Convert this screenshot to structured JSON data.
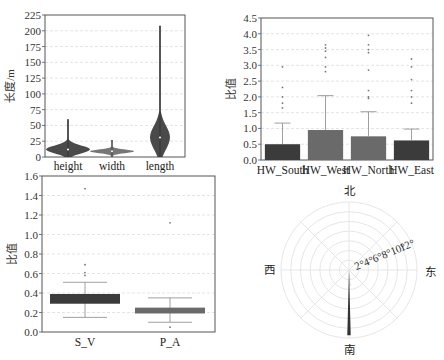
{
  "colors": {
    "dark": "#3b3b3b",
    "mid": "#6a6a6a",
    "grid": "#dddddd",
    "frame": "#555555"
  },
  "chart_data": [
    {
      "id": "violin",
      "type": "violin",
      "title": "",
      "xlabel": "",
      "ylabel": "长度/m",
      "ylim": [
        0,
        225
      ],
      "yticks": [
        "0",
        "25",
        "50",
        "75",
        "100",
        "125",
        "150",
        "175",
        "200",
        "225"
      ],
      "grid": true,
      "categories": [
        "height",
        "width",
        "length"
      ],
      "series": [
        {
          "name": "height",
          "min": 0,
          "max": 60,
          "median": 12,
          "mode": 12
        },
        {
          "name": "width",
          "min": 0,
          "max": 27,
          "median": 9,
          "mode": 9
        },
        {
          "name": "length",
          "min": 0,
          "max": 208,
          "median": 31,
          "mode": 31
        }
      ]
    },
    {
      "id": "hw_bar",
      "type": "bar",
      "title": "",
      "xlabel": "",
      "ylabel": "比值",
      "ylim": [
        0,
        4.5
      ],
      "yticks": [
        "0.0",
        "0.5",
        "1.0",
        "1.5",
        "2.0",
        "2.5",
        "3.0",
        "3.5",
        "4.0",
        "4.5"
      ],
      "grid": true,
      "categories": [
        "HW_South",
        "HW_West",
        "HW_North",
        "HW_East"
      ],
      "values": [
        0.5,
        0.95,
        0.75,
        0.62
      ],
      "error_upper": [
        1.17,
        2.04,
        1.53,
        0.98
      ],
      "outliers": [
        [
          1.65,
          1.8,
          2.0,
          2.3,
          2.95
        ],
        [
          2.8,
          2.95,
          3.25,
          3.45,
          3.55,
          3.65
        ],
        [
          1.95,
          2.0,
          2.2,
          2.85,
          3.4,
          3.5,
          3.65,
          3.95
        ],
        [
          1.8,
          2.0,
          2.2,
          2.55,
          2.95,
          3.2
        ]
      ]
    },
    {
      "id": "ratio_box",
      "type": "bar",
      "title": "",
      "xlabel": "",
      "ylabel": "比值",
      "ylim": [
        0,
        1.6
      ],
      "yticks": [
        "0.0",
        "0.2",
        "0.4",
        "0.6",
        "0.8",
        "1.0",
        "1.2",
        "1.4",
        "1.6"
      ],
      "grid": true,
      "categories": [
        "S_V",
        "P_A"
      ],
      "box_low": [
        0.29,
        0.19
      ],
      "box_high": [
        0.39,
        0.25
      ],
      "whisker_low": [
        0.15,
        0.1
      ],
      "whisker_high": [
        0.51,
        0.35
      ],
      "outliers": [
        [
          0.58,
          0.61,
          0.69,
          1.47
        ],
        [
          0.05,
          1.12
        ]
      ]
    },
    {
      "id": "polar_rose",
      "type": "polar",
      "title": "",
      "directions": {
        "north": "北",
        "south": "南",
        "east": "东",
        "west": "西"
      },
      "radial_ticks": [
        "2",
        "4",
        "6",
        "8",
        "10",
        "12"
      ],
      "radial_unit": "°",
      "rmax": 13,
      "bars": [
        {
          "angle_deg": 180,
          "width_deg": 3,
          "value": 12.5
        },
        {
          "angle_deg": 176,
          "width_deg": 1.5,
          "value": 3.0
        }
      ]
    }
  ]
}
